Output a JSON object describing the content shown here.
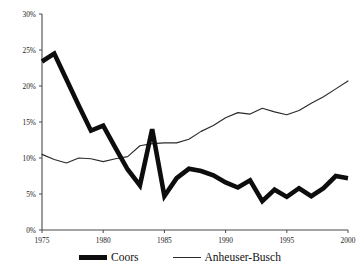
{
  "chart_data": {
    "type": "line",
    "title": "",
    "xlabel": "",
    "ylabel": "",
    "xlim": [
      1975,
      2000
    ],
    "ylim": [
      0,
      30
    ],
    "grid": false,
    "legend_position": "bottom-center",
    "x": [
      1975,
      1976,
      1977,
      1978,
      1979,
      1980,
      1981,
      1982,
      1983,
      1984,
      1985,
      1986,
      1987,
      1988,
      1989,
      1990,
      1991,
      1992,
      1993,
      1994,
      1995,
      1996,
      1997,
      1998,
      1999,
      2000
    ],
    "xticks": [
      1975,
      1980,
      1985,
      1990,
      1995,
      2000
    ],
    "xtick_labels": [
      "1975",
      "1980",
      "1985",
      "1990",
      "1995",
      "2000"
    ],
    "yticks": [
      0,
      5,
      10,
      15,
      20,
      25,
      30
    ],
    "ytick_labels": [
      "0%",
      "5%",
      "10%",
      "15%",
      "20%",
      "25%",
      "30%"
    ],
    "series": [
      {
        "name": "Coors",
        "style": "thick",
        "color": "#0d0d0d",
        "values": [
          23.4,
          24.5,
          20.9,
          17.3,
          13.8,
          14.5,
          11.4,
          8.4,
          6.2,
          14.0,
          4.7,
          7.2,
          8.5,
          8.2,
          7.6,
          6.6,
          5.9,
          6.9,
          4.0,
          5.6,
          4.6,
          5.8,
          4.7,
          5.8,
          7.5,
          7.2
        ]
      },
      {
        "name": "Anheuser-Busch",
        "style": "thin",
        "color": "#2b2b2b",
        "values": [
          10.5,
          9.8,
          9.3,
          10.0,
          9.9,
          9.5,
          9.9,
          10.2,
          11.7,
          12.0,
          12.1,
          12.1,
          12.6,
          13.7,
          14.5,
          15.6,
          16.3,
          16.1,
          16.9,
          16.4,
          16.0,
          16.6,
          17.6,
          18.5,
          19.6,
          20.7
        ]
      }
    ]
  },
  "legend": {
    "items": [
      {
        "label": "Coors",
        "style": "thick"
      },
      {
        "label": "Anheuser-Busch",
        "style": "thin"
      }
    ]
  }
}
